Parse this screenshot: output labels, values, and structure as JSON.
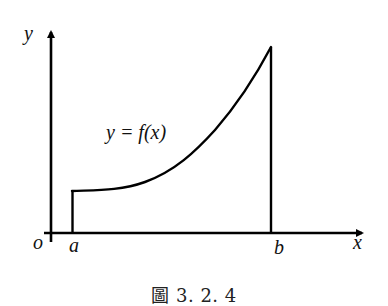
{
  "figure": {
    "caption": "圖 3. 2. 4",
    "function_label": "y = f(x)",
    "axis_labels": {
      "x": "x",
      "y": "y",
      "origin": "o"
    },
    "tick_labels": {
      "a": "a",
      "b": "b"
    },
    "colors": {
      "stroke": "#000000",
      "background": "#ffffff"
    }
  }
}
